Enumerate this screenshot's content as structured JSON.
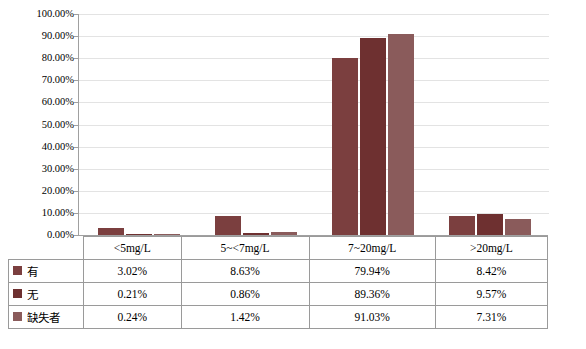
{
  "chart_data": {
    "type": "bar",
    "title": "",
    "subtitle": "",
    "xlabel": "",
    "ylabel": "",
    "grid": true,
    "legend_position": "table-left",
    "ylim": [
      0,
      100
    ],
    "ytick_labels": [
      "0.00%",
      "10.00%",
      "20.00%",
      "30.00%",
      "40.00%",
      "50.00%",
      "60.00%",
      "70.00%",
      "80.00%",
      "90.00%",
      "100.00%"
    ],
    "ytick_values": [
      0,
      10,
      20,
      30,
      40,
      50,
      60,
      70,
      80,
      90,
      100
    ],
    "categories": [
      "<5mg/L",
      "5~<7mg/L",
      "7~20mg/L",
      ">20mg/L"
    ],
    "series": [
      {
        "name": "有",
        "color": "#7b3f3f",
        "values": [
          3.02,
          8.63,
          79.94,
          8.42
        ],
        "labels": [
          "3.02%",
          "8.63%",
          "79.94%",
          "8.42%"
        ]
      },
      {
        "name": "无",
        "color": "#6e3030",
        "values": [
          0.21,
          0.86,
          89.36,
          9.57
        ],
        "labels": [
          "0.21%",
          "0.86%",
          "89.36%",
          "9.57%"
        ]
      },
      {
        "name": "缺失者",
        "color": "#8a5b5b",
        "values": [
          0.24,
          1.42,
          91.03,
          7.31
        ],
        "labels": [
          "0.24%",
          "1.42%",
          "91.03%",
          "7.31%"
        ]
      }
    ]
  },
  "caption": ""
}
